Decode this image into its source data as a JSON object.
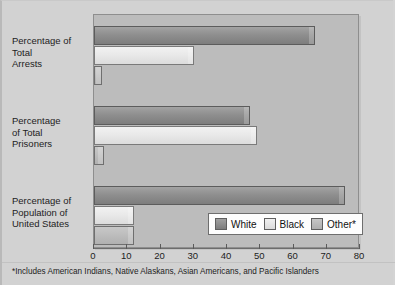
{
  "chart_data": {
    "type": "bar",
    "orientation": "horizontal",
    "title": "",
    "xlabel": "",
    "ylabel": "",
    "xlim": [
      0,
      80
    ],
    "xticks": [
      0,
      10,
      20,
      30,
      40,
      50,
      60,
      70,
      80
    ],
    "grid": false,
    "legend_position": "inside-bottom-right",
    "categories": [
      "Percentage of Total Arrests",
      "Percentage of Total Prisoners",
      "Percentage of Population of United States"
    ],
    "category_label_lines": [
      [
        "Percentage of",
        "Total",
        "Arrests"
      ],
      [
        "Percentage",
        "of Total",
        "Prisoners"
      ],
      [
        "Percentage of",
        "Population of",
        "United States"
      ]
    ],
    "series": [
      {
        "name": "White",
        "color": "#8f8f8f",
        "values": [
          66.5,
          47.0,
          75.5
        ]
      },
      {
        "name": "Black",
        "color": "#e8e8e8",
        "values": [
          30.0,
          49.0,
          12.0
        ]
      },
      {
        "name": "Other*",
        "color": "#bcbcbc",
        "values": [
          2.5,
          3.0,
          12.0
        ]
      }
    ],
    "annotations": [
      "*Includes American Indians, Native Alaskans, Asian Americans, and Pacific Islanders"
    ]
  },
  "legend": {
    "entries": [
      {
        "label": "White"
      },
      {
        "label": "Black"
      },
      {
        "label": "Other*"
      }
    ]
  },
  "axis": {
    "tick_labels": [
      "0",
      "10",
      "20",
      "30",
      "40",
      "50",
      "60",
      "70",
      "80"
    ]
  },
  "footnote": {
    "text": "*Includes American Indians, Native Alaskans, Asian Americans, and Pacific Islanders"
  }
}
